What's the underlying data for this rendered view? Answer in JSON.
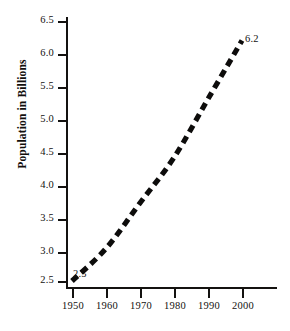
{
  "chart_data": {
    "type": "line",
    "title": "",
    "subtitle": "",
    "xlabel": "",
    "ylabel": "Population in Billions",
    "x": [
      1950,
      1960,
      1970,
      1980,
      1990,
      2000
    ],
    "xtick_labels": [
      "1950",
      "1960",
      "1970",
      "1980",
      "1990",
      "2000"
    ],
    "ytick_labels": [
      "6.5",
      "6.0",
      "5.5",
      "5.0",
      "4.5",
      "4.0",
      "3.5",
      "3.0",
      "2.5"
    ],
    "ytick_values": [
      6.5,
      6.0,
      5.5,
      5.0,
      4.5,
      4.0,
      3.5,
      3.0,
      2.5
    ],
    "series": [
      {
        "name": "World population",
        "values": [
          2.5,
          3.0,
          3.7,
          4.4,
          5.3,
          6.2
        ],
        "style": "dashed",
        "color": "#0d0c0b"
      }
    ],
    "annotations": [
      {
        "text": "2.5",
        "x": 1950,
        "y": 2.5,
        "position": "below-right"
      },
      {
        "text": "6.2",
        "x": 2000,
        "y": 6.2,
        "position": "above-right"
      }
    ],
    "xlim": [
      1948,
      2006
    ],
    "ylim": [
      2.3,
      6.6
    ],
    "grid": false,
    "legend": false,
    "legend_position": "none",
    "background_color": "#ffffff",
    "axis_color": "#141210"
  }
}
